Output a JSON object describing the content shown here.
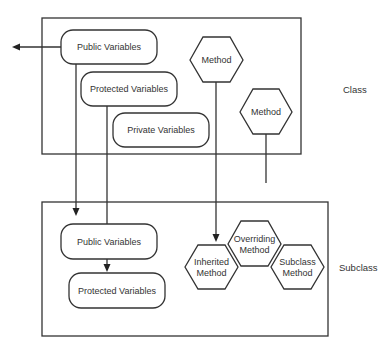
{
  "diagram": {
    "class_box": {
      "label": "Class",
      "variables": {
        "public": "Public Variables",
        "protected": "Protected Variables",
        "private": "Private Variables"
      },
      "methods": [
        "Method",
        "Method"
      ]
    },
    "subclass_box": {
      "label": "Subclass",
      "variables": {
        "public": "Public Variables",
        "protected": "Protected Variables"
      },
      "methods": {
        "inherited": [
          "Inherited",
          "Method"
        ],
        "overriding": [
          "Overriding",
          "Method"
        ],
        "subclass": [
          "Subclass",
          "Method"
        ]
      }
    },
    "connections": [
      {
        "from": "class.public_variables",
        "to": "external",
        "type": "arrow"
      },
      {
        "from": "class.public_variables",
        "to": "subclass.public_variables",
        "type": "arrow"
      },
      {
        "from": "class.protected_variables",
        "to": "subclass.public_variables",
        "type": "line"
      },
      {
        "from": "subclass.public_variables",
        "to": "subclass.protected_variables",
        "type": "arrow"
      },
      {
        "from": "class.method_1",
        "to": "subclass.inherited_method",
        "type": "arrow"
      },
      {
        "from": "class.method_2",
        "to": "none",
        "type": "line"
      }
    ]
  }
}
